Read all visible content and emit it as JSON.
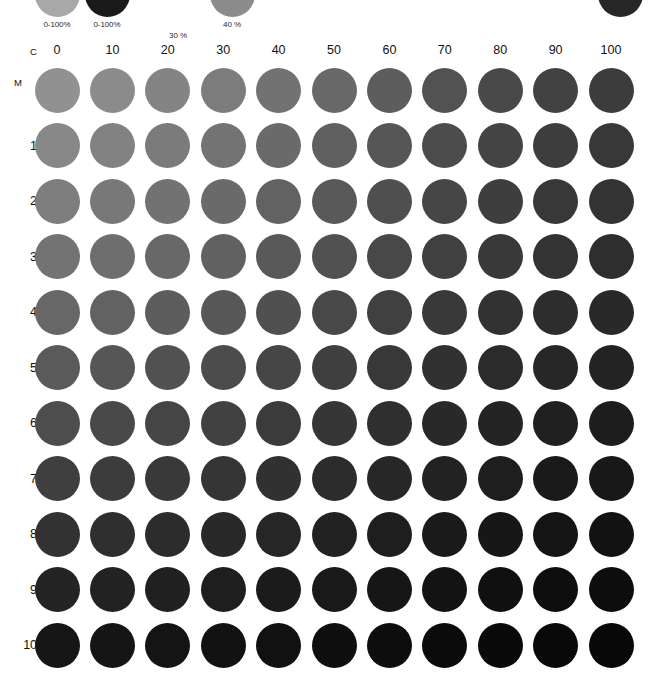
{
  "chart_data": {
    "type": "heatmap",
    "xlabel": "C",
    "ylabel": "M",
    "categories": [
      "0",
      "10",
      "20",
      "30",
      "40",
      "50",
      "60",
      "70",
      "80",
      "90",
      "100"
    ],
    "rows": [
      "0",
      "10",
      "20",
      "30",
      "40",
      "50",
      "60",
      "70",
      "80",
      "90",
      "100"
    ],
    "x": [
      0,
      10,
      20,
      30,
      40,
      50,
      60,
      70,
      80,
      90,
      100
    ],
    "y": [
      0,
      10,
      20,
      30,
      40,
      50,
      60,
      70,
      80,
      90,
      100
    ],
    "xlim": [
      0,
      100
    ],
    "ylim": [
      0,
      100
    ],
    "grid": false,
    "legend_position": "top",
    "marker": "circle",
    "values": [
      [
        145,
        139,
        132,
        124,
        114,
        104,
        93,
        82,
        73,
        66,
        60
      ],
      [
        136,
        130,
        123,
        115,
        106,
        96,
        86,
        76,
        68,
        61,
        56
      ],
      [
        126,
        120,
        114,
        106,
        98,
        89,
        79,
        70,
        62,
        56,
        51
      ],
      [
        115,
        110,
        104,
        97,
        89,
        81,
        72,
        64,
        57,
        51,
        46
      ],
      [
        103,
        98,
        93,
        87,
        80,
        72,
        64,
        57,
        50,
        45,
        41
      ],
      [
        90,
        86,
        81,
        76,
        70,
        63,
        56,
        49,
        43,
        39,
        35
      ],
      [
        77,
        73,
        69,
        65,
        59,
        54,
        47,
        41,
        36,
        32,
        29
      ],
      [
        63,
        60,
        57,
        53,
        49,
        44,
        39,
        34,
        30,
        26,
        24
      ],
      [
        50,
        47,
        44,
        41,
        38,
        34,
        30,
        26,
        23,
        20,
        18
      ],
      [
        36,
        34,
        32,
        30,
        27,
        25,
        22,
        19,
        16,
        14,
        13
      ],
      [
        22,
        21,
        20,
        18,
        17,
        15,
        13,
        11,
        10,
        9,
        8
      ]
    ],
    "annotations": [
      "Top-left swatch C0 M0 is the lightest tone",
      "Bottom-right swatch C100 M100 is the darkest tone"
    ]
  },
  "legend": {
    "items": [
      {
        "label": "0-100%",
        "color": "#a8a8a8",
        "visible_dot": true
      },
      {
        "label": "0-100%",
        "color": "#1a1a1a",
        "visible_dot": true
      },
      {
        "label": "30 %",
        "color": "#ffffff",
        "visible_dot": false
      },
      {
        "label": "40 %",
        "color": "#8c8c8c",
        "visible_dot": true
      },
      {
        "label": "",
        "color": "#262626",
        "visible_dot": true
      }
    ]
  },
  "axes": {
    "c_label": "C",
    "m_label": "M",
    "columns": [
      "0",
      "10",
      "20",
      "30",
      "40",
      "50",
      "60",
      "70",
      "80",
      "90",
      "100"
    ],
    "rows": [
      "0",
      "10",
      "20",
      "30",
      "40",
      "50",
      "60",
      "70",
      "80",
      "90",
      "100"
    ]
  },
  "colors": {
    "background": "#ffffff",
    "text": "#111111",
    "lightest_swatch": "#919186",
    "darkest_swatch": "#080808"
  }
}
